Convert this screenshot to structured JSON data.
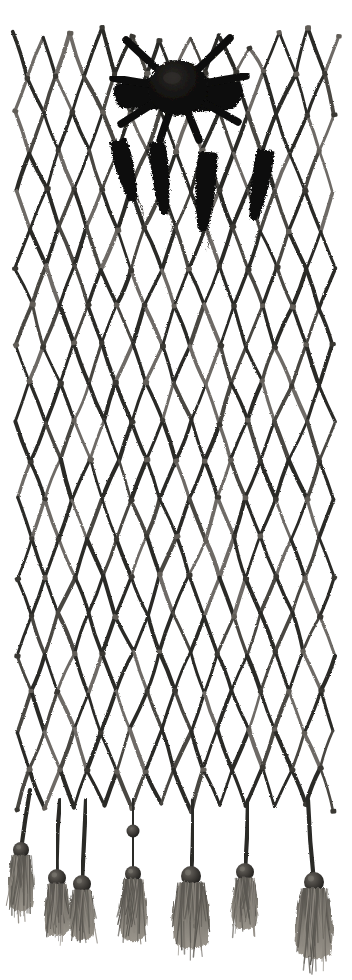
{
  "image": {
    "subject": "netted fiber artifact",
    "description": "Hand-knotted diamond-mesh net panel with dark bundled mass at top center, four dark pendant objects hanging below it, and a row of beaded fiber tassels along the lower edge",
    "background_color": "#ffffff",
    "cord_color": "#2b2a28",
    "cord_highlight_color": "#6e6b66",
    "dark_mass_color": "#0d0d0c",
    "bead_color": "#3a3836",
    "tassel_color": "#6b6762",
    "width": 352,
    "height": 980
  },
  "net": {
    "label": "diamond mesh net panel",
    "left_edge_x": 16,
    "right_edge_x": 334,
    "top_edge_y": 36,
    "bottom_edge_y": 808,
    "columns": 11,
    "rows": 20,
    "cell_width": 30,
    "cell_height": 38,
    "cord_width": 3.4,
    "knot_color": "#55524d"
  },
  "central_mass": {
    "label": "dark bundled mass",
    "center_x": 178,
    "center_y": 88,
    "radius_x": 30,
    "radius_y": 28,
    "wing_left_x": 116,
    "wing_right_x": 240,
    "color": "#0c0c0b"
  },
  "pendants": {
    "label": "hanging dark pendant objects",
    "items": [
      {
        "name": "pendant-1",
        "x": 118,
        "y": 140,
        "w": 17,
        "h": 60,
        "tilt": -14
      },
      {
        "name": "pendant-2",
        "x": 157,
        "y": 142,
        "w": 16,
        "h": 70,
        "tilt": -6
      },
      {
        "name": "pendant-3",
        "x": 208,
        "y": 152,
        "w": 19,
        "h": 76,
        "tilt": 4
      },
      {
        "name": "pendant-4",
        "x": 266,
        "y": 150,
        "w": 17,
        "h": 68,
        "tilt": 10
      }
    ]
  },
  "tassels": {
    "label": "beaded fringe tassels",
    "count": 7,
    "items": [
      {
        "name": "tassel-1",
        "anchor_x": 30,
        "anchor_y": 790,
        "bead_x": 21,
        "bead_y": 850,
        "bead_r": 8,
        "tuft_h": 52,
        "tuft_w": 26,
        "beads": 1
      },
      {
        "name": "tassel-2",
        "anchor_x": 60,
        "anchor_y": 800,
        "bead_x": 57,
        "bead_y": 878,
        "bead_r": 9,
        "tuft_h": 48,
        "tuft_w": 26,
        "beads": 1
      },
      {
        "name": "tassel-3",
        "anchor_x": 86,
        "anchor_y": 800,
        "bead_x": 82,
        "bead_y": 884,
        "bead_r": 9,
        "tuft_h": 46,
        "tuft_w": 27,
        "beads": 1
      },
      {
        "name": "tassel-4",
        "anchor_x": 133,
        "anchor_y": 800,
        "bead_x": 133,
        "bead_y": 874,
        "bead_r": 8,
        "tuft_h": 58,
        "tuft_w": 28,
        "beads": 2
      },
      {
        "name": "tassel-5",
        "anchor_x": 193,
        "anchor_y": 800,
        "bead_x": 191,
        "bead_y": 876,
        "bead_r": 10,
        "tuft_h": 62,
        "tuft_w": 38,
        "beads": 1
      },
      {
        "name": "tassel-6",
        "anchor_x": 248,
        "anchor_y": 800,
        "bead_x": 245,
        "bead_y": 872,
        "bead_r": 9,
        "tuft_h": 48,
        "tuft_w": 26,
        "beads": 1
      },
      {
        "name": "tassel-7",
        "anchor_x": 308,
        "anchor_y": 800,
        "bead_x": 314,
        "bead_y": 882,
        "bead_r": 10,
        "tuft_h": 66,
        "tuft_w": 38,
        "beads": 1
      }
    ]
  }
}
